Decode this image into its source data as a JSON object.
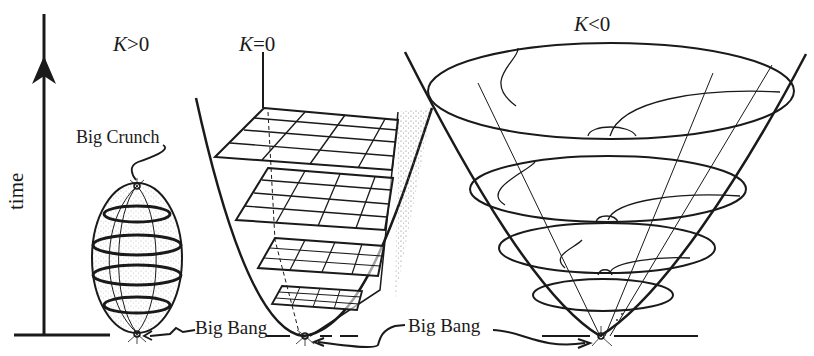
{
  "figure": {
    "type": "cosmology-geometry-diagram",
    "axis": {
      "label": "time",
      "direction": "up"
    },
    "panels": [
      {
        "id": "closed",
        "curvature_label_var": "K",
        "curvature_label_rel": ">0",
        "shape": "ellipsoid",
        "annotations": [
          "Big Crunch",
          "Big Bang"
        ]
      },
      {
        "id": "flat",
        "curvature_label_var": "K",
        "curvature_label_rel": "=0",
        "shape": "paraboloid with flat grid slices",
        "slice_count": 5,
        "annotations": [
          "Big Bang"
        ]
      },
      {
        "id": "open",
        "curvature_label_var": "K",
        "curvature_label_rel": "<0",
        "shape": "hyperbolic cone with elliptical slices",
        "slice_count": 4,
        "annotations": [
          "Big Bang"
        ]
      }
    ],
    "labels": {
      "big_crunch": "Big Crunch",
      "big_bang_left": "Big Bang",
      "big_bang_shared": "Big Bang"
    },
    "colors": {
      "ink": "#1a1a1a",
      "paper": "#ffffff",
      "stipple": "#777777"
    }
  }
}
